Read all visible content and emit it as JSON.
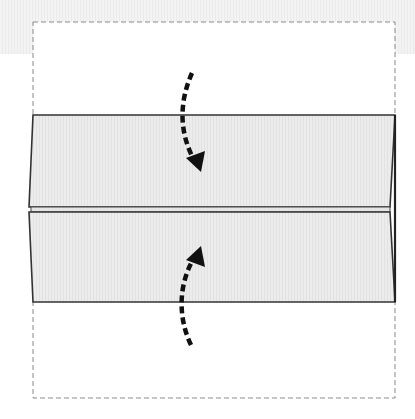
{
  "diagram": {
    "title": "Fold top and bottom edges to the center crease",
    "colors": {
      "background": "#ffffff",
      "top_band": "#eeeeee",
      "frame_dash": "#8a8a8a",
      "panel_fill": "#ececec",
      "panel_stripe": "#e2e2e2",
      "panel_stroke": "#333333",
      "arrow": "#111111"
    },
    "frame": {
      "x": 33,
      "y": 22,
      "width": 362,
      "height": 376,
      "style": "dashed"
    },
    "panels": [
      {
        "name": "top-flap",
        "points": "33,115 395,115 390,207 29,207"
      },
      {
        "name": "bottom-flap",
        "points": "29,212 390,212 395,302 33,302"
      }
    ],
    "crease_gap": {
      "y_top": 207,
      "y_bottom": 212
    },
    "arrows": [
      {
        "name": "fold-down-arrow",
        "direction": "down",
        "path": "M192,73 C180,100 178,130 196,162",
        "head": "188,158 204,150 200,172"
      },
      {
        "name": "fold-up-arrow",
        "direction": "up",
        "path": "M191,345 C178,318 178,285 196,256",
        "head": "188,260 204,268 200,246"
      }
    ]
  }
}
